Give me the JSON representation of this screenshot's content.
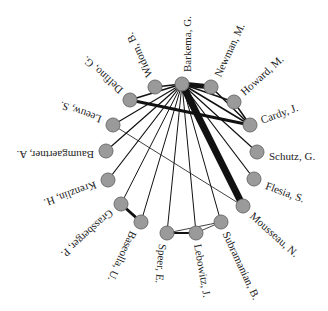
{
  "diagram": {
    "type": "collaboration-network",
    "layout": "circular",
    "colors": {
      "node_fill": "#9a9a9a",
      "node_stroke": "#6e6e6e",
      "edge": "#111111",
      "background": "#ffffff"
    },
    "node_radius": 7,
    "nodes": [
      {
        "id": "barkema",
        "label": "Barkema, G.",
        "x": 182,
        "y": 84,
        "lx": 187,
        "ly": 72,
        "rot": -90
      },
      {
        "id": "newman",
        "label": "Newman, M.",
        "x": 211,
        "y": 87,
        "lx": 217,
        "ly": 76,
        "rot": -65
      },
      {
        "id": "howard",
        "label": "Howard, M.",
        "x": 234,
        "y": 102,
        "lx": 242,
        "ly": 93,
        "rot": -42
      },
      {
        "id": "cardy",
        "label": "Cardy, J.",
        "x": 250,
        "y": 125,
        "lx": 261,
        "ly": 120,
        "rot": -20
      },
      {
        "id": "schutz",
        "label": "Schutz, G.",
        "x": 257,
        "y": 152,
        "lx": 269,
        "ly": 156,
        "rot": 0
      },
      {
        "id": "flesia",
        "label": "Flesia, S.",
        "x": 254,
        "y": 179,
        "lx": 266,
        "ly": 185,
        "rot": 20
      },
      {
        "id": "mousseau",
        "label": "Mousseau, N.",
        "x": 243,
        "y": 206,
        "lx": 252,
        "ly": 214,
        "rot": 42
      },
      {
        "id": "subramanian",
        "label": "Subramanian, B.",
        "x": 221,
        "y": 222,
        "lx": 226,
        "ly": 232,
        "rot": 65
      },
      {
        "id": "lebowitz",
        "label": "Lebowitz, J.",
        "x": 196,
        "y": 233,
        "lx": 198,
        "ly": 244,
        "rot": 80
      },
      {
        "id": "speer",
        "label": "Speer, E.",
        "x": 167,
        "y": 233,
        "lx": 163,
        "ly": 244,
        "rot": 95
      },
      {
        "id": "baseolla",
        "label": "Baseolla, U.",
        "x": 141,
        "y": 222,
        "lx": 134,
        "ly": 232,
        "rot": 115
      },
      {
        "id": "grassberger",
        "label": "Grassberger, P.",
        "x": 121,
        "y": 204,
        "lx": 112,
        "ly": 212,
        "rot": 138
      },
      {
        "id": "krenzlin",
        "label": "Krenzlin, H.",
        "x": 108,
        "y": 180,
        "lx": 96,
        "ly": 185,
        "rot": 160
      },
      {
        "id": "baumgaertner",
        "label": "Baumgaertner, A.",
        "x": 106,
        "y": 151,
        "lx": 94,
        "ly": 155,
        "rot": 180
      },
      {
        "id": "leeuw",
        "label": "Leeuw, S.",
        "x": 113,
        "y": 125,
        "lx": 101,
        "ly": 120,
        "rot": 200
      },
      {
        "id": "delfino",
        "label": "Delfino, G.",
        "x": 130,
        "y": 100,
        "lx": 121,
        "ly": 92,
        "rot": 222
      },
      {
        "id": "widom",
        "label": "Widom, B.",
        "x": 155,
        "y": 87,
        "lx": 149,
        "ly": 77,
        "rot": 245
      }
    ],
    "edges": [
      {
        "from": "barkema",
        "to": "newman",
        "width": 5
      },
      {
        "from": "barkema",
        "to": "howard",
        "width": 1.5
      },
      {
        "from": "barkema",
        "to": "cardy",
        "width": 1.5
      },
      {
        "from": "barkema",
        "to": "schutz",
        "width": 1.2
      },
      {
        "from": "barkema",
        "to": "flesia",
        "width": 1.2
      },
      {
        "from": "barkema",
        "to": "mousseau",
        "width": 7
      },
      {
        "from": "barkema",
        "to": "subramanian",
        "width": 1
      },
      {
        "from": "barkema",
        "to": "lebowitz",
        "width": 1
      },
      {
        "from": "barkema",
        "to": "speer",
        "width": 1
      },
      {
        "from": "barkema",
        "to": "baseolla",
        "width": 1
      },
      {
        "from": "barkema",
        "to": "grassberger",
        "width": 1
      },
      {
        "from": "barkema",
        "to": "krenzlin",
        "width": 1.2
      },
      {
        "from": "barkema",
        "to": "baumgaertner",
        "width": 1.2
      },
      {
        "from": "barkema",
        "to": "leeuw",
        "width": 1.2
      },
      {
        "from": "barkema",
        "to": "delfino",
        "width": 1.5
      },
      {
        "from": "barkema",
        "to": "widom",
        "width": 1.5
      },
      {
        "from": "newman",
        "to": "cardy",
        "width": 1.5
      },
      {
        "from": "howard",
        "to": "cardy",
        "width": 1.5
      },
      {
        "from": "delfino",
        "to": "cardy",
        "width": 3
      },
      {
        "from": "leeuw",
        "to": "mousseau",
        "width": 0.8
      },
      {
        "from": "grassberger",
        "to": "baseolla",
        "width": 3
      },
      {
        "from": "speer",
        "to": "lebowitz",
        "width": 1.8
      },
      {
        "from": "speer",
        "to": "subramanian",
        "width": 0.8
      },
      {
        "from": "lebowitz",
        "to": "subramanian",
        "width": 0.8
      }
    ]
  }
}
